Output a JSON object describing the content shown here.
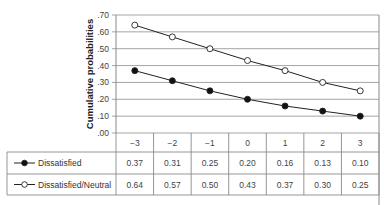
{
  "chart_data": {
    "type": "line",
    "title": "",
    "xlabel": "",
    "ylabel": "Cumulative probabilities",
    "ylim": [
      0,
      0.7
    ],
    "y_ticks": [
      ".00",
      ".10",
      ".20",
      ".30",
      ".40",
      ".50",
      ".60",
      ".70"
    ],
    "grid": true,
    "legend_position": "table-left",
    "categories": [
      "−3",
      "−2",
      "−1",
      "0",
      "1",
      "2",
      "3"
    ],
    "x": [
      -3,
      -2,
      -1,
      0,
      1,
      2,
      3
    ],
    "series": [
      {
        "name": "Dissatisfied",
        "marker": "filled-circle",
        "values": [
          0.37,
          0.31,
          0.25,
          0.2,
          0.16,
          0.13,
          0.1
        ]
      },
      {
        "name": "Dissatisfied/Neutral",
        "marker": "open-circle",
        "values": [
          0.64,
          0.57,
          0.5,
          0.43,
          0.37,
          0.3,
          0.25
        ]
      }
    ],
    "data_table": {
      "header": [
        "−3",
        "−2",
        "−1",
        "0",
        "1",
        "2",
        "3"
      ],
      "rows": [
        {
          "label": "Dissatisfied",
          "cells": [
            "0.37",
            "0.31",
            "0.25",
            "0.20",
            "0.16",
            "0.13",
            "0.10"
          ]
        },
        {
          "label": "Dissatisfied/Neutral",
          "cells": [
            "0.64",
            "0.57",
            "0.50",
            "0.43",
            "0.37",
            "0.30",
            "0.25"
          ]
        }
      ]
    }
  },
  "colors": {
    "line": "#222222",
    "grid": "#9a9a9a",
    "border": "#8a8a8a"
  }
}
